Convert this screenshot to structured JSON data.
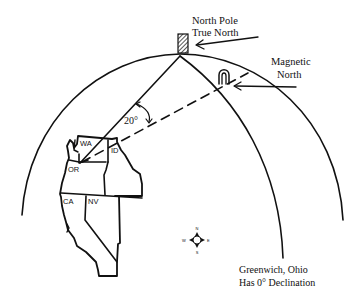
{
  "labels": {
    "north_pole_line1": "North Pole",
    "north_pole_line2": "True North",
    "magnetic_line1": "Magnetic",
    "magnetic_line2": "North",
    "angle": "20°",
    "greenwich_line1": "Greenwich, Ohio",
    "greenwich_line2": "Has 0° Declination"
  },
  "states": {
    "wa": "WA",
    "id": "ID",
    "or": "OR",
    "ca": "CA",
    "nv": "NV"
  },
  "compass": {
    "n": "N",
    "s": "S",
    "e": "E",
    "w": "W"
  },
  "colors": {
    "ink": "#111111",
    "background": "#ffffff"
  }
}
